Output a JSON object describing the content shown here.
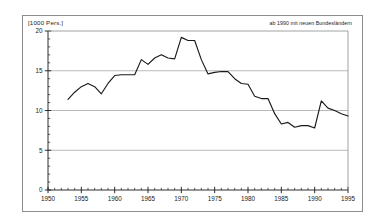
{
  "figure": {
    "unit_label": "[1000 Pers.]",
    "note": "ab 1990 mit neuen Bundesländern",
    "frame_color": "#8c8c8c",
    "line_color": "#1a1a1a",
    "grid_color": "#a8a8a8",
    "background": "#ffffff"
  },
  "chart_data": {
    "type": "line",
    "title": "",
    "subtitle": "",
    "xlabel": "",
    "ylabel": "[1000 Pers.]",
    "xlim": [
      1950,
      1995
    ],
    "ylim": [
      0,
      20
    ],
    "grid": true,
    "grid_axis": "y",
    "legend": null,
    "annotations": [
      {
        "text": "ab 1990 mit neuen Bundesländern",
        "position": "top-right"
      }
    ],
    "y_ticks": [
      0,
      5,
      10,
      15,
      20
    ],
    "y_tick_labels": [
      "0",
      "5",
      "10",
      "15",
      "20"
    ],
    "y_minor_tick_step": 1,
    "x_ticks": [
      1950,
      1955,
      1960,
      1965,
      1970,
      1975,
      1980,
      1985,
      1990,
      1995
    ],
    "x_tick_labels": [
      "1950",
      "1955",
      "1960",
      "1965",
      "1970",
      "1975",
      "1980",
      "1985",
      "1990",
      "1995"
    ],
    "x_minor_tick_step": 1,
    "series": [
      {
        "name": "",
        "x": [
          1953,
          1954,
          1955,
          1956,
          1957,
          1958,
          1959,
          1960,
          1961,
          1962,
          1963,
          1964,
          1965,
          1966,
          1967,
          1968,
          1969,
          1970,
          1971,
          1972,
          1973,
          1974,
          1975,
          1976,
          1977,
          1978,
          1979,
          1980,
          1981,
          1982,
          1983,
          1984,
          1985,
          1986,
          1987,
          1988,
          1989,
          1990,
          1991,
          1992,
          1993,
          1994,
          1995
        ],
        "values": [
          11.4,
          12.3,
          13.0,
          13.4,
          13.0,
          12.1,
          13.4,
          14.4,
          14.5,
          14.5,
          14.5,
          16.4,
          15.8,
          16.6,
          17.0,
          16.6,
          16.5,
          19.2,
          18.8,
          18.8,
          16.4,
          14.6,
          14.8,
          14.9,
          14.9,
          14.0,
          13.4,
          13.3,
          11.8,
          11.5,
          11.5,
          9.6,
          8.3,
          8.5,
          7.9,
          8.1,
          8.1,
          7.8,
          11.2,
          10.3,
          10.0,
          9.6,
          9.3
        ]
      }
    ]
  }
}
